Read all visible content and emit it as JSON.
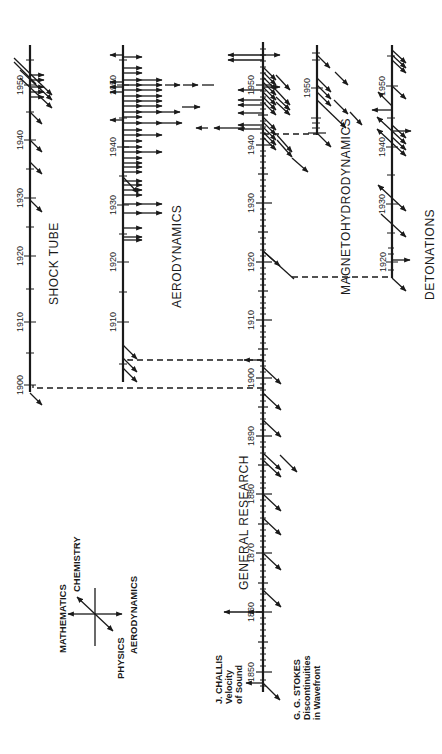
{
  "diagram": {
    "orientation": "rotated-90-ccw",
    "branches": [
      {
        "id": "general",
        "label": "GENERAL RESEARCH",
        "years": [
          "1850",
          "1860",
          "1870",
          "1880",
          "1890",
          "1900",
          "1910",
          "1920",
          "1930",
          "1940",
          "1950"
        ]
      },
      {
        "id": "shock_tube",
        "label": "SHOCK TUBE",
        "years": [
          "1900",
          "1910",
          "1920",
          "1930",
          "1940",
          "1950"
        ]
      },
      {
        "id": "aerodynamics",
        "label": "AERODYNAMICS",
        "years": [
          "1910",
          "1920",
          "1930",
          "1940",
          "1950"
        ]
      },
      {
        "id": "mhd",
        "label": "MAGNETOHYDRODYNAMICS",
        "years": [
          "1950"
        ]
      },
      {
        "id": "detonations",
        "label": "DETONATIONS",
        "years": [
          "1920",
          "1930",
          "1940",
          "1950"
        ]
      }
    ],
    "annotations": {
      "challis_line1": "J. CHALLIS",
      "challis_line2": "Velocity",
      "challis_line3": "of Sound",
      "stokes_line1": "G. G. STOKES",
      "stokes_line2": "Discontinuities",
      "stokes_line3": "in Wavefront"
    },
    "legend": {
      "mathematics": "MATHEMATICS",
      "chemistry": "CHEMISTRY",
      "physics": "PHYSICS",
      "aerodynamics": "AERODYNAMICS"
    },
    "colors": {
      "ink": "#1a1a1a",
      "paper": "#ffffff"
    }
  }
}
